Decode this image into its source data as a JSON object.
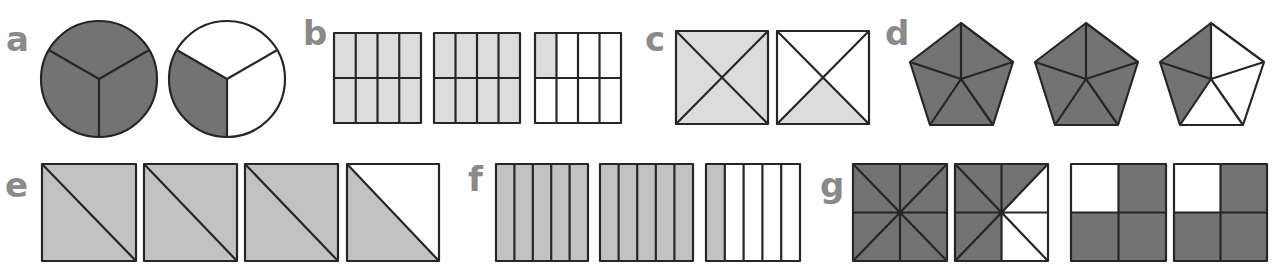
{
  "colors": {
    "dark_fill": "#737373",
    "light_fill": "#dcdcdc",
    "medium_fill": "#c2c2c2",
    "white": "#ffffff",
    "stroke": "#262626",
    "label": "#8a8a8a"
  },
  "groups": [
    {
      "label": "a",
      "description": "Circles divided into 3 equal parts",
      "shapes": [
        {
          "type": "circle",
          "parts": 3,
          "shaded": 3
        },
        {
          "type": "circle",
          "parts": 3,
          "shaded": 1
        }
      ]
    },
    {
      "label": "b",
      "description": "Rectangles divided into 8 equal parts",
      "shapes": [
        {
          "type": "grid-4x2",
          "parts": 8,
          "shaded": 8
        },
        {
          "type": "grid-4x2",
          "parts": 8,
          "shaded": 8
        },
        {
          "type": "grid-4x2",
          "parts": 8,
          "shaded": 1
        }
      ]
    },
    {
      "label": "c",
      "description": "Squares divided diagonally into 4 parts",
      "shapes": [
        {
          "type": "square-x",
          "parts": 4,
          "shaded": 4
        },
        {
          "type": "square-x",
          "parts": 4,
          "shaded": 1
        }
      ]
    },
    {
      "label": "d",
      "description": "Pentagons divided into 5 parts",
      "shapes": [
        {
          "type": "pentagon",
          "parts": 5,
          "shaded": 5
        },
        {
          "type": "pentagon",
          "parts": 5,
          "shaded": 5
        },
        {
          "type": "pentagon",
          "parts": 5,
          "shaded": 2
        }
      ]
    },
    {
      "label": "e",
      "description": "Squares split into 2 triangles",
      "shapes": [
        {
          "type": "square-diagonal",
          "parts": 2,
          "shaded": 2
        },
        {
          "type": "square-diagonal",
          "parts": 2,
          "shaded": 2
        },
        {
          "type": "square-diagonal",
          "parts": 2,
          "shaded": 2
        },
        {
          "type": "square-diagonal",
          "parts": 2,
          "shaded": 1
        }
      ]
    },
    {
      "label": "f",
      "description": "Squares divided into 5 vertical strips",
      "shapes": [
        {
          "type": "strips-5",
          "parts": 5,
          "shaded": 5
        },
        {
          "type": "strips-5",
          "parts": 5,
          "shaded": 5
        },
        {
          "type": "strips-5",
          "parts": 5,
          "shaded": 1
        }
      ]
    },
    {
      "label": "g",
      "description": "Squares divided into 8 triangles and 4 quarters",
      "shapes": [
        {
          "type": "square-8",
          "parts": 8,
          "shaded": 8
        },
        {
          "type": "square-8",
          "parts": 8,
          "shaded": 5
        },
        {
          "type": "square-4",
          "parts": 4,
          "shaded": 3
        },
        {
          "type": "square-4",
          "parts": 4,
          "shaded": 3
        }
      ]
    }
  ]
}
